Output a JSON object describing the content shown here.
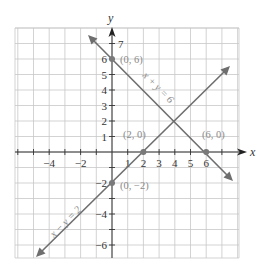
{
  "chart_data": {
    "type": "line",
    "title": "",
    "xlabel": "x",
    "ylabel": "y",
    "xlim": [
      -6,
      8
    ],
    "ylim": [
      -7,
      8
    ],
    "grid": true,
    "x_tick_labels": [
      "-4",
      "-2",
      "1",
      "2",
      "3",
      "4",
      "5",
      "6"
    ],
    "y_tick_labels": [
      "7",
      "6",
      "5",
      "4",
      "3",
      "2",
      "1",
      "-2",
      "-4",
      "-6"
    ],
    "series": [
      {
        "name": "x + y = 6",
        "equation": "x + y = 6",
        "x": [
          -1.5,
          7.5
        ],
        "y": [
          7.5,
          -1.5
        ],
        "color": "#6e6e6e"
      },
      {
        "name": "x − y = 2",
        "equation": "x − y = 2",
        "x": [
          -4.7,
          7.5
        ],
        "y": [
          -6.7,
          5.5
        ],
        "color": "#6e6e6e"
      }
    ],
    "points": [
      {
        "label": "(0, 6)",
        "x": 0,
        "y": 6
      },
      {
        "label": "(2, 0)",
        "x": 2,
        "y": 0
      },
      {
        "label": "(6, 0)",
        "x": 6,
        "y": 0
      },
      {
        "label": "(0, −2)",
        "x": 0,
        "y": -2
      }
    ],
    "annotations": [
      "x + y = 6",
      "x − y = 2"
    ]
  },
  "axes": {
    "x_name": "x",
    "y_name": "y"
  },
  "ticks": {
    "x": [
      {
        "v": -4,
        "label": "−4"
      },
      {
        "v": -2,
        "label": "−2"
      },
      {
        "v": 1,
        "label": "1"
      },
      {
        "v": 2,
        "label": "2"
      },
      {
        "v": 3,
        "label": "3"
      },
      {
        "v": 4,
        "label": "4"
      },
      {
        "v": 5,
        "label": "5"
      },
      {
        "v": 6,
        "label": "6"
      }
    ],
    "y": [
      {
        "v": 7,
        "label": "7"
      },
      {
        "v": 6,
        "label": "6"
      },
      {
        "v": 5,
        "label": "5"
      },
      {
        "v": 4,
        "label": "4"
      },
      {
        "v": 3,
        "label": "3"
      },
      {
        "v": 2,
        "label": "2"
      },
      {
        "v": 1,
        "label": "1"
      },
      {
        "v": -2,
        "label": "−2"
      },
      {
        "v": -4,
        "label": "−4"
      },
      {
        "v": -6,
        "label": "−6"
      }
    ]
  },
  "point_labels": {
    "p06": "(0, 6)",
    "p20": "(2, 0)",
    "p60": "(6, 0)",
    "p0m2": "(0, −2)"
  },
  "line_labels": {
    "sum": "x + y = 6",
    "diff": "x − y = 2"
  },
  "colors": {
    "grid": "#c8c8c8",
    "axis": "#333333",
    "line": "#6e6e6e",
    "point": "#7a7a7a",
    "label": "#8a8a8a"
  }
}
